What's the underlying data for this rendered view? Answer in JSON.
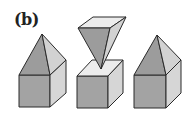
{
  "figure": {
    "panel_label": "(b)",
    "colors": {
      "front_face": "#a3a3a3",
      "side_face": "#d6d6d6",
      "top_face": "#ececec",
      "pyramid_dark": "#9c9c9c",
      "pyramid_light": "#d2d2d2",
      "edge": "#2a2a2a"
    },
    "shapes": [
      {
        "name": "pyramid-on-cube-left",
        "cube": {
          "front": "19,75 50,75 50,107 19,107",
          "side": "50,75 66,60 66,93 50,107"
        },
        "pyramid": {
          "dark": "42,34 19,75 50,75",
          "light": "42,34 50,75 66,60"
        }
      },
      {
        "name": "inverted-pyramid-over-cube",
        "cube": {
          "front": "77,76 108,76 108,108 77,108",
          "side": "108,76 123,60 123,93 108,108",
          "top": "77,76 108,76 123,60 92,60"
        },
        "pyramid": {
          "top": "93,17 126,17 110,28 78,28",
          "dark": "78,28 110,28 101,69",
          "light": "110,28 126,17 101,69"
        }
      },
      {
        "name": "pyramid-on-cube-right",
        "cube": {
          "front": "134,75 166,75 166,108 134,108",
          "side": "166,75 181,60 181,93 166,108"
        },
        "pyramid": {
          "dark": "157,35 134,75 166,75",
          "light": "157,35 166,75 181,60"
        }
      }
    ]
  }
}
